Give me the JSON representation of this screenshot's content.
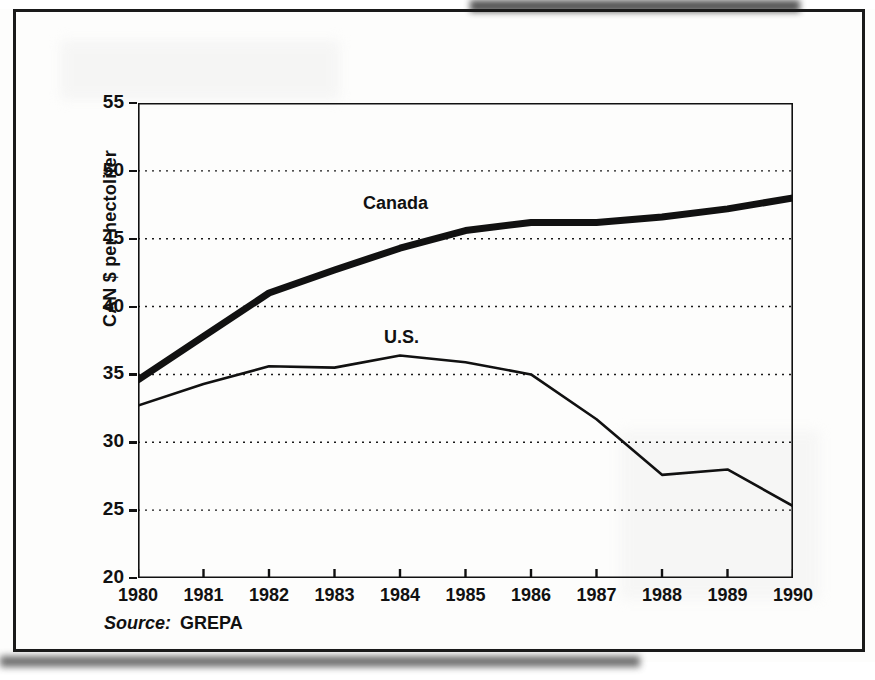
{
  "figure": {
    "source_label": "Source:",
    "source_value": "GREPA"
  },
  "chart_data": {
    "type": "line",
    "title": "",
    "xlabel": "",
    "ylabel": "CAN $ per hectoliter",
    "x": [
      1980,
      1981,
      1982,
      1983,
      1984,
      1985,
      1986,
      1987,
      1988,
      1989,
      1990
    ],
    "xtick_labels": [
      "1980",
      "1981",
      "1982",
      "1983",
      "1984",
      "1985",
      "1986",
      "1987",
      "1988",
      "1989",
      "1990"
    ],
    "ytick_labels": [
      "20",
      "25",
      "30",
      "35",
      "40",
      "45",
      "50",
      "55"
    ],
    "yticks": [
      20,
      25,
      30,
      35,
      40,
      45,
      50,
      55
    ],
    "xlim": [
      1980,
      1990
    ],
    "ylim": [
      20,
      55
    ],
    "grid": "horizontal-dotted",
    "legend": "inline-labels",
    "series": [
      {
        "name": "Canada",
        "label_text": "Canada",
        "color": "#111111",
        "line_width": 7,
        "values": [
          34.6,
          37.8,
          41.0,
          42.7,
          44.3,
          45.6,
          46.2,
          46.2,
          46.6,
          47.2,
          48.0
        ]
      },
      {
        "name": "U.S.",
        "label_text": "U.S.",
        "color": "#111111",
        "line_width": 2.6,
        "values": [
          32.7,
          34.3,
          35.6,
          35.5,
          36.4,
          35.9,
          35.0,
          31.7,
          27.6,
          28.0,
          25.3
        ]
      }
    ]
  }
}
